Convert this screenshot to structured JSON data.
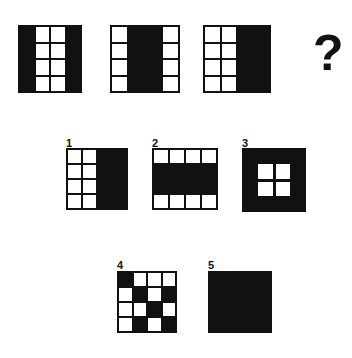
{
  "puzzle": {
    "type": "matrix-reasoning-visual-analogy",
    "prompt_symbol": "?",
    "sequence": [
      {
        "id": "seq-1",
        "rows": 4,
        "cols": 4,
        "gridlines": true,
        "pattern": [
          [
            "b",
            "w",
            "w",
            "b"
          ],
          [
            "b",
            "w",
            "w",
            "b"
          ],
          [
            "b",
            "w",
            "w",
            "b"
          ],
          [
            "b",
            "w",
            "w",
            "b"
          ]
        ]
      },
      {
        "id": "seq-2",
        "rows": 4,
        "cols": 4,
        "gridlines": true,
        "pattern": [
          [
            "w",
            "b",
            "b",
            "w"
          ],
          [
            "w",
            "b",
            "b",
            "w"
          ],
          [
            "w",
            "b",
            "b",
            "w"
          ],
          [
            "w",
            "b",
            "b",
            "w"
          ]
        ]
      },
      {
        "id": "seq-3",
        "rows": 4,
        "cols": 4,
        "gridlines": true,
        "pattern": [
          [
            "w",
            "w",
            "b",
            "b"
          ],
          [
            "w",
            "w",
            "b",
            "b"
          ],
          [
            "w",
            "w",
            "b",
            "b"
          ],
          [
            "w",
            "w",
            "b",
            "b"
          ]
        ]
      }
    ],
    "options": [
      {
        "number": "1",
        "style": "grid",
        "rows": 4,
        "cols": 4,
        "gridlines": true,
        "pattern": [
          [
            "w",
            "w",
            "b",
            "b"
          ],
          [
            "w",
            "w",
            "b",
            "b"
          ],
          [
            "w",
            "w",
            "b",
            "b"
          ],
          [
            "w",
            "w",
            "b",
            "b"
          ]
        ]
      },
      {
        "number": "2",
        "style": "grid",
        "rows": 4,
        "cols": 4,
        "gridlines": true,
        "pattern": [
          [
            "w",
            "w",
            "w",
            "w"
          ],
          [
            "b",
            "b",
            "b",
            "b"
          ],
          [
            "b",
            "b",
            "b",
            "b"
          ],
          [
            "w",
            "w",
            "w",
            "w"
          ]
        ]
      },
      {
        "number": "3",
        "style": "nested",
        "outer_color": "#111111",
        "inner_color": "#ffffff",
        "inner_rows": 2,
        "inner_cols": 2
      },
      {
        "number": "4",
        "style": "grid",
        "rows": 4,
        "cols": 4,
        "gridlines": true,
        "pattern": [
          [
            "b",
            "w",
            "w",
            "w"
          ],
          [
            "w",
            "b",
            "w",
            "b"
          ],
          [
            "w",
            "w",
            "b",
            "w"
          ],
          [
            "w",
            "b",
            "w",
            "b"
          ]
        ]
      },
      {
        "number": "5",
        "style": "solid",
        "fill": "#111111"
      }
    ],
    "colors": {
      "ink": "#111111",
      "paper": "#ffffff"
    }
  }
}
